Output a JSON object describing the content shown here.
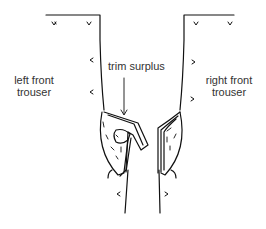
{
  "diagram": {
    "labels": {
      "left_line1": "left front",
      "left_line2": "trouser",
      "right_line1": "right front",
      "right_line2": "trouser",
      "trim": "trim surplus"
    },
    "colors": {
      "stroke": "#111111",
      "text": "#333333",
      "background": "#ffffff"
    }
  }
}
